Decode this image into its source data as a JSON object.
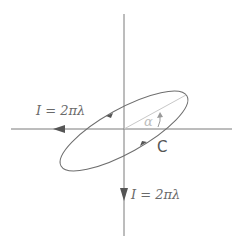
{
  "diagram": {
    "labels": {
      "horizontal_current": "I = 2πλ",
      "vertical_current": "I = 2πλ",
      "angle": "α",
      "contour": "C"
    },
    "colors": {
      "axis": "#7a7a7a",
      "ellipse": "#6e6e6e",
      "chord": "#c8c8c8",
      "text": "#6a6a6a",
      "angle_text": "#bdbdbd"
    }
  }
}
